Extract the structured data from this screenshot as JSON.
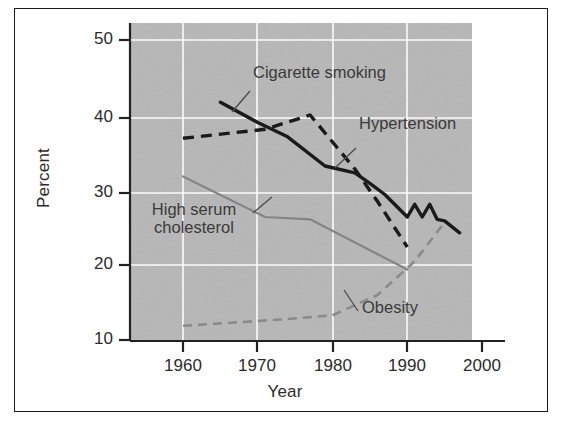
{
  "chart_data": {
    "type": "line",
    "title": "",
    "subtitle": "",
    "xlabel": "Year",
    "ylabel": "Percent",
    "xlim": [
      1953,
      2006
    ],
    "ylim": [
      10,
      52
    ],
    "xticks": [
      1960,
      1970,
      1980,
      1990,
      2000
    ],
    "yticks": [
      10,
      20,
      30,
      40,
      50
    ],
    "grid": true,
    "grid_color": "#ffffff",
    "plot_background": "#b3b3b3",
    "legend_position": "inline-annotations",
    "series": [
      {
        "name": "Cigarette smoking",
        "style": "solid",
        "color": "#1a1a1a",
        "width": 3.4,
        "label_x": 1972,
        "label_y": 45.6,
        "x": [
          1965,
          1970,
          1974,
          1979,
          1983,
          1985,
          1987,
          1990,
          1991,
          1992,
          1993,
          1994,
          1995,
          1997
        ],
        "y": [
          41.7,
          39.0,
          37.1,
          33.2,
          32.3,
          30.9,
          29.4,
          26.4,
          28.1,
          26.4,
          28.1,
          26.1,
          25.9,
          24.3
        ]
      },
      {
        "name": "Hypertension",
        "style": "dashed",
        "color": "#1a1a1a",
        "width": 3.4,
        "label_x": 1982,
        "label_y": 38.6,
        "x": [
          1960,
          1971,
          1977,
          1983,
          1986,
          1990
        ],
        "y": [
          36.9,
          38.1,
          40.0,
          32.8,
          28.5,
          22.4
        ]
      },
      {
        "name": "High serum cholesterol",
        "style": "solid",
        "color": "#858585",
        "width": 2.2,
        "label_x": 1965,
        "label_y": 22.8,
        "x": [
          1960,
          1971,
          1977,
          1990
        ],
        "y": [
          31.8,
          26.4,
          26.1,
          19.4
        ]
      },
      {
        "name": "Obesity",
        "style": "dashed",
        "color": "#8a8a8a",
        "width": 2.6,
        "label_x": 1986,
        "label_y": 15.5,
        "x": [
          1960,
          1968,
          1974,
          1980,
          1986,
          1991,
          1995
        ],
        "y": [
          11.9,
          12.4,
          12.8,
          13.3,
          16.0,
          20.5,
          25.7
        ]
      }
    ]
  },
  "axes": {
    "ylabel": "Percent",
    "xlabel": "Year",
    "ytick_labels": [
      "50",
      "40",
      "30",
      "20",
      "10"
    ],
    "xtick_labels": [
      "1960",
      "1970",
      "1980",
      "1990",
      "2000"
    ]
  },
  "annotations": [
    {
      "text": "Cigarette smoking",
      "name": "label-cigarette-smoking"
    },
    {
      "text": "Hypertension",
      "name": "label-hypertension"
    },
    {
      "text": "High serum cholesterol",
      "name": "label-high-serum-cholesterol"
    },
    {
      "text": "Obesity",
      "name": "label-obesity"
    }
  ]
}
